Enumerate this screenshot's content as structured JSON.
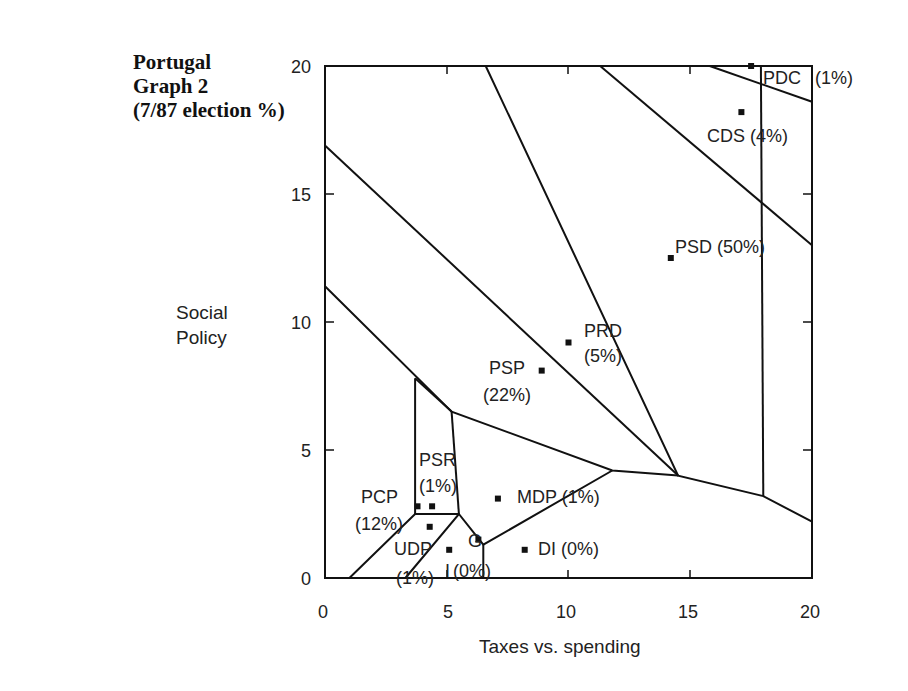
{
  "title": {
    "line1": "Portugal",
    "line2": "Graph 2",
    "line3": "(7/87 election %)"
  },
  "axes": {
    "xlabel": "Taxes vs. spending",
    "ylabel_line1": "Social",
    "ylabel_line2": "Policy"
  },
  "chart_data": {
    "type": "scatter",
    "title": "Portugal Graph 2 (7/87 election %)",
    "xlabel": "Taxes vs. spending",
    "ylabel": "Social Policy",
    "xlim": [
      0,
      20
    ],
    "ylim": [
      0,
      20
    ],
    "xticks": [
      0,
      5,
      10,
      15,
      20
    ],
    "yticks": [
      0,
      5,
      10,
      15,
      20
    ],
    "grid": false,
    "legend": "none",
    "points": [
      {
        "label": "PDC",
        "pct": "(1%)",
        "x": 17.5,
        "y": 20.0
      },
      {
        "label": "CDS",
        "pct": "(4%)",
        "x": 17.1,
        "y": 18.2
      },
      {
        "label": "PSD",
        "pct": "(50%)",
        "x": 14.2,
        "y": 12.5
      },
      {
        "label": "PRD",
        "pct": "(5%)",
        "x": 10.0,
        "y": 9.2
      },
      {
        "label": "PSP",
        "pct": "(22%)",
        "x": 8.9,
        "y": 8.1
      },
      {
        "label": "PSR",
        "pct": "(1%)",
        "x": 4.4,
        "y": 2.8
      },
      {
        "label": "PCP",
        "pct": "(12%)",
        "x": 3.8,
        "y": 2.8
      },
      {
        "label": "MDP",
        "pct": "(1%)",
        "x": 7.1,
        "y": 3.1
      },
      {
        "label": "UDP",
        "pct": "(1%)",
        "x": 4.3,
        "y": 2.0
      },
      {
        "label": "I",
        "pct": "(0%)",
        "x": 5.1,
        "y": 1.1
      },
      {
        "label": "G",
        "pct": "",
        "x": 6.3,
        "y": 1.5
      },
      {
        "label": "DI",
        "pct": "(0%)",
        "x": 8.2,
        "y": 1.1
      }
    ],
    "region_boundaries": [
      [
        [
          6.6,
          20
        ],
        [
          14.5,
          4.0
        ],
        [
          18.0,
          3.2
        ],
        [
          20,
          2.2
        ]
      ],
      [
        [
          11.3,
          20
        ],
        [
          20,
          13.0
        ]
      ],
      [
        [
          15.8,
          20
        ],
        [
          20,
          18.6
        ]
      ],
      [
        [
          0,
          16.9
        ],
        [
          14.5,
          4.0
        ]
      ],
      [
        [
          0,
          11.4
        ],
        [
          5.2,
          6.5
        ],
        [
          11.8,
          4.2
        ],
        [
          14.5,
          4.0
        ]
      ],
      [
        [
          3.7,
          7.8
        ],
        [
          5.2,
          6.5
        ]
      ],
      [
        [
          3.7,
          7.8
        ],
        [
          3.7,
          2.5
        ]
      ],
      [
        [
          5.2,
          6.5
        ],
        [
          5.5,
          2.5
        ]
      ],
      [
        [
          1.0,
          0
        ],
        [
          3.7,
          2.5
        ],
        [
          5.5,
          2.5
        ]
      ],
      [
        [
          3.3,
          0
        ],
        [
          5.5,
          2.5
        ],
        [
          6.5,
          1.3
        ],
        [
          11.8,
          4.2
        ]
      ],
      [
        [
          6.5,
          1.3
        ],
        [
          6.5,
          0
        ]
      ],
      [
        [
          17.9,
          20
        ],
        [
          18.0,
          3.2
        ]
      ]
    ]
  },
  "ticks": {
    "x": [
      "0",
      "5",
      "10",
      "15",
      "20"
    ],
    "y": [
      "0",
      "5",
      "10",
      "15",
      "20"
    ]
  },
  "labels": {
    "pdc_name": "PDC",
    "pdc_pct": "(1%)",
    "cds": "CDS (4%)",
    "psd": "PSD (50%)",
    "prd_name": "PRD",
    "prd_pct": "(5%)",
    "psp_name": "PSP",
    "psp_pct": "(22%)",
    "psr_name": "PSR",
    "psr_pct": "(1%)",
    "pcp_name": "PCP",
    "pcp_pct": "(12%)",
    "mdp": "MDP (1%)",
    "udp_name": "UDP",
    "udp_pct": "(1%)",
    "g_name": "G",
    "i_name": "I",
    "i_pct": "(0%)",
    "di": "DI (0%)"
  }
}
